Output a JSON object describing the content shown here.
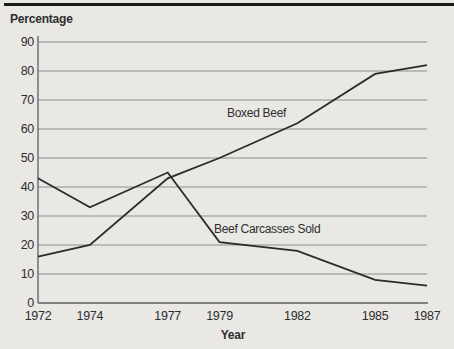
{
  "chart_data": {
    "type": "line",
    "title": "",
    "ylabel": "Percentage",
    "xlabel": "Year",
    "x": [
      1972,
      1974,
      1977,
      1979,
      1982,
      1985,
      1987
    ],
    "x_tick_labels": [
      "1972",
      "1974",
      "1977",
      "1979",
      "1982",
      "1985",
      "1987"
    ],
    "y_ticks": [
      0,
      10,
      20,
      30,
      40,
      50,
      60,
      70,
      80,
      90
    ],
    "xlim": [
      1972,
      1987
    ],
    "ylim": [
      0,
      90
    ],
    "grid": "horizontal",
    "legend": "inline-text-labels",
    "series": [
      {
        "name": "Boxed Beef",
        "values": [
          16,
          20,
          43,
          50,
          62,
          79,
          82
        ]
      },
      {
        "name": "Beef Carcasses Sold",
        "values": [
          43,
          33,
          45,
          21,
          18,
          8,
          6
        ]
      }
    ],
    "colors": {
      "background": "#e9e8e5",
      "top_rule": "#1a1a1a",
      "line": "#2b2b2b",
      "grid": "#8f8e8c",
      "axis": "#5f5e5c",
      "text": "#2e2e2e"
    }
  }
}
